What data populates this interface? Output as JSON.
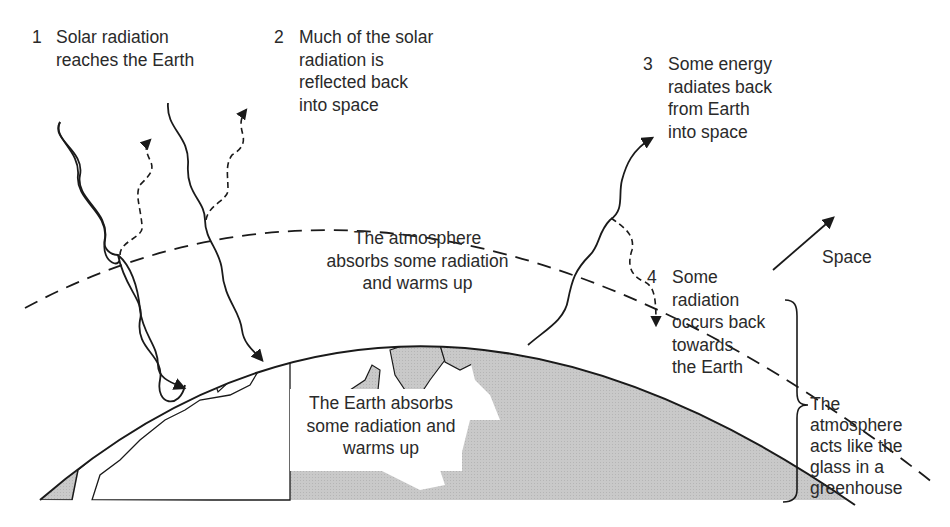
{
  "steps": [
    {
      "number": "1",
      "lines": [
        "Solar radiation",
        "reaches the Earth"
      ]
    },
    {
      "number": "2",
      "lines": [
        "Much of the solar",
        "radiation is",
        "reflected back",
        "into space"
      ]
    },
    {
      "number": "3",
      "lines": [
        "Some energy",
        "radiates back",
        "from Earth",
        "into space"
      ]
    },
    {
      "number": "4",
      "lines": [
        "Some",
        "radiation",
        "occurs back",
        "towards",
        "the Earth"
      ]
    }
  ],
  "atmosphere_label": [
    "The atmosphere",
    "absorbs some radiation",
    "and warms up"
  ],
  "earth_label": [
    "The Earth absorbs",
    "some radiation and",
    "warms up"
  ],
  "space_label": "Space",
  "greenhouse_label": [
    "The",
    "atmosphere",
    "acts like the",
    "glass in a",
    "greenhouse"
  ],
  "colors": {
    "line": "#1a1a1a",
    "land": "#c8c8c8",
    "background": "#ffffff"
  }
}
